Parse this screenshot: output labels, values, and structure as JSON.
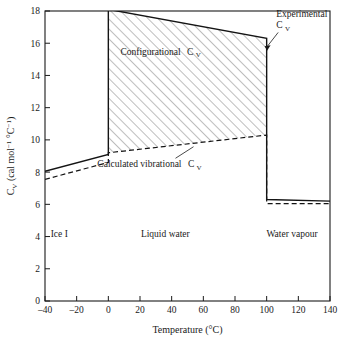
{
  "chart_data": {
    "type": "line",
    "title": "",
    "xlabel": "Temperature (°C)",
    "ylabel": "Cᵥ (cal mol⁻¹ °C⁻¹)",
    "ylabel_parts": {
      "symbol": "C",
      "symbol_sub": "V",
      "units_open": " (cal mol",
      "units_sup1": "−1",
      "units_mid": " °C",
      "units_sup2": "−1",
      "units_close": ")"
    },
    "xlim": [
      -40,
      140
    ],
    "ylim": [
      0,
      18
    ],
    "xticks": [
      -40,
      -20,
      0,
      20,
      40,
      60,
      80,
      100,
      120,
      140
    ],
    "xtick_labels": [
      "–40",
      "–20",
      "0",
      "20",
      "40",
      "60",
      "80",
      "100",
      "120",
      "140"
    ],
    "yticks": [
      0,
      2,
      4,
      6,
      8,
      10,
      12,
      14,
      16,
      18
    ],
    "ytick_labels": [
      "0",
      "2",
      "4",
      "6",
      "8",
      "10",
      "12",
      "14",
      "16",
      "18"
    ],
    "grid": false,
    "legend_position": "none",
    "tick_direction": "in",
    "series": [
      {
        "name": "Experimental C_V",
        "style": "solid",
        "color": "#141414",
        "points": [
          [
            -40,
            8.05
          ],
          [
            0,
            9.1
          ],
          [
            0,
            18.1
          ],
          [
            100,
            16.3
          ],
          [
            100,
            6.3
          ],
          [
            140,
            6.2
          ]
        ]
      },
      {
        "name": "Calculated vibrational C_V",
        "style": "dashed",
        "color": "#141414",
        "points": [
          [
            -40,
            7.55
          ],
          [
            0,
            8.6
          ],
          [
            0,
            9.2
          ],
          [
            100,
            10.3
          ],
          [
            100,
            6.05
          ],
          [
            140,
            6.05
          ]
        ]
      }
    ],
    "shaded_region": {
      "name": "Configurational C_V",
      "hatch": "forward-diagonal",
      "hatch_color": "#6e6e6e",
      "upper_boundary": [
        [
          0,
          18.1
        ],
        [
          100,
          16.3
        ]
      ],
      "lower_boundary": [
        [
          0,
          9.2
        ],
        [
          100,
          10.3
        ]
      ]
    },
    "annotations": [
      {
        "name": "configurational-label",
        "text": "Configurational",
        "symbol": "C",
        "symbol_sub": "V",
        "x": 33,
        "y": 15.3
      },
      {
        "name": "experimental-label",
        "line1": "Experimental",
        "line2_symbol": "C",
        "line2_sub": "V",
        "x": 106,
        "y": 17.6,
        "leader_to": [
          99,
          15.6
        ]
      },
      {
        "name": "calculated-vibrational-label",
        "text": "Calculated vibrational",
        "symbol": "C",
        "symbol_sub": "V",
        "x": 26,
        "y": 8.3,
        "leader_to": [
          50,
          9.7
        ]
      }
    ],
    "region_labels": [
      {
        "name": "ice-region",
        "text": "Ice I",
        "x": -31,
        "y": 3.95
      },
      {
        "name": "liquid-region",
        "text": "Liquid water",
        "x": 36,
        "y": 3.95
      },
      {
        "name": "vapour-region",
        "text": "Water vapour",
        "x": 116,
        "y": 3.95
      }
    ],
    "phase_boundaries": [
      0,
      100
    ],
    "colors": {
      "axis": "#1a1a1a",
      "curve": "#141414",
      "hatch": "#6e6e6e",
      "background": "#ffffff"
    }
  }
}
